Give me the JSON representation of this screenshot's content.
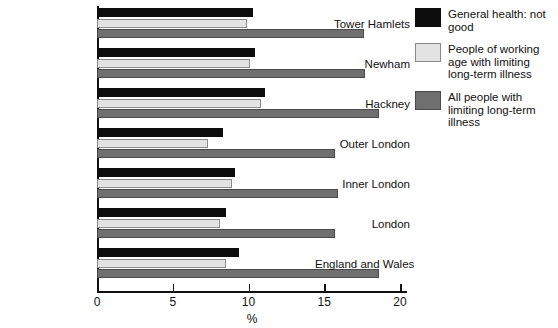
{
  "chart_data": {
    "type": "bar",
    "orientation": "horizontal",
    "title": "",
    "xlabel": "%",
    "ylabel": "",
    "xlim": [
      0,
      20
    ],
    "xticks": [
      "0",
      "5",
      "10",
      "15",
      "20"
    ],
    "grid": false,
    "legend_position": "right",
    "categories": [
      "Tower Hamlets",
      "Newham",
      "Hackney",
      "Outer London",
      "Inner London",
      "London",
      "England and Wales"
    ],
    "series": [
      {
        "name": "General health: not good",
        "color": "#0d0d0d",
        "values": [
          10.3,
          10.4,
          11.1,
          8.3,
          9.1,
          8.5,
          9.4
        ]
      },
      {
        "name": "People of working age with limiting long-term illness",
        "color": "#e3e3e3",
        "values": [
          9.9,
          10.1,
          10.8,
          7.3,
          8.9,
          8.1,
          8.5
        ]
      },
      {
        "name": "All people with limiting long-term illness",
        "color": "#6f6f6f",
        "values": [
          17.6,
          17.7,
          18.6,
          15.7,
          15.9,
          15.7,
          18.6
        ]
      }
    ]
  },
  "legend": {
    "items": [
      {
        "label": "General health: not good",
        "swatch": "s0"
      },
      {
        "label": "People of working age with limiting long-term illness",
        "swatch": "s1"
      },
      {
        "label": "All people with limiting long-term illness",
        "swatch": "s2"
      }
    ]
  }
}
